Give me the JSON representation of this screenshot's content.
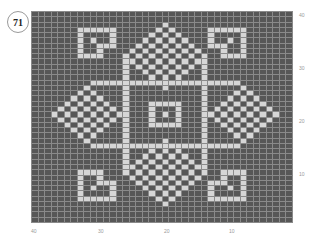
{
  "pattern_number": "71",
  "colors": {
    "background_stitch": "#575757",
    "contrast_stitch": "#d6d6d6",
    "grid_line": "#8a8a8a"
  },
  "chart": {
    "columns": 40,
    "rows": 40,
    "row_labels": [
      "40",
      "30",
      "20",
      "10"
    ],
    "column_labels": [
      "40",
      "30",
      "20",
      "10"
    ],
    "light_cells_by_row": [
      [],
      [],
      [
        20
      ],
      [
        7,
        8,
        9,
        10,
        11,
        12,
        19,
        21,
        27,
        28,
        29,
        30,
        31,
        32
      ],
      [
        7,
        12,
        18,
        20,
        22,
        27,
        32
      ],
      [
        7,
        9,
        12,
        17,
        19,
        21,
        23,
        27,
        30,
        32
      ],
      [
        7,
        10,
        11,
        12,
        16,
        18,
        20,
        22,
        24,
        27,
        28,
        29,
        32
      ],
      [
        7,
        10,
        15,
        17,
        19,
        21,
        23,
        25,
        29,
        32
      ],
      [
        7,
        8,
        9,
        10,
        14,
        16,
        18,
        20,
        22,
        24,
        26,
        29,
        30,
        31,
        32
      ],
      [
        14,
        15,
        17,
        19,
        21,
        23,
        25,
        26
      ],
      [
        14,
        16,
        18,
        20,
        22,
        24,
        26
      ],
      [
        14,
        17,
        19,
        21,
        23,
        26
      ],
      [
        14,
        18,
        20,
        22,
        26
      ],
      [
        9,
        10,
        11,
        12,
        13,
        14,
        15,
        16,
        17,
        18,
        19,
        20,
        21,
        22,
        23,
        24,
        25,
        26,
        27,
        28,
        29,
        30,
        31
      ],
      [
        8,
        14,
        20,
        26,
        32
      ],
      [
        7,
        9,
        14,
        26,
        31,
        33
      ],
      [
        6,
        8,
        10,
        14,
        26,
        30,
        32,
        34
      ],
      [
        5,
        7,
        9,
        11,
        14,
        18,
        19,
        20,
        21,
        22,
        26,
        29,
        31,
        33,
        35
      ],
      [
        4,
        6,
        8,
        10,
        12,
        14,
        18,
        22,
        26,
        28,
        30,
        32,
        34,
        36
      ],
      [
        3,
        5,
        7,
        9,
        11,
        13,
        14,
        18,
        20,
        22,
        26,
        27,
        29,
        31,
        33,
        35,
        37
      ],
      [
        4,
        6,
        8,
        10,
        12,
        14,
        18,
        22,
        26,
        28,
        30,
        32,
        34,
        36
      ],
      [
        5,
        7,
        9,
        11,
        14,
        18,
        19,
        20,
        21,
        22,
        26,
        29,
        31,
        33,
        35
      ],
      [
        6,
        8,
        10,
        14,
        26,
        30,
        32,
        34
      ],
      [
        7,
        9,
        14,
        26,
        31,
        33
      ],
      [
        8,
        14,
        20,
        26,
        32
      ],
      [
        9,
        10,
        11,
        12,
        13,
        14,
        15,
        16,
        17,
        18,
        19,
        20,
        21,
        22,
        23,
        24,
        25,
        26,
        27,
        28,
        29,
        30,
        31
      ],
      [
        14,
        18,
        20,
        22,
        26
      ],
      [
        14,
        17,
        19,
        21,
        23,
        26
      ],
      [
        14,
        16,
        18,
        20,
        22,
        24,
        26
      ],
      [
        14,
        15,
        17,
        19,
        21,
        23,
        25,
        26
      ],
      [
        7,
        8,
        9,
        10,
        14,
        16,
        18,
        20,
        22,
        24,
        26,
        29,
        30,
        31,
        32
      ],
      [
        7,
        10,
        15,
        17,
        19,
        21,
        23,
        25,
        29,
        32
      ],
      [
        7,
        10,
        11,
        12,
        16,
        18,
        20,
        22,
        24,
        27,
        28,
        29,
        32
      ],
      [
        7,
        9,
        12,
        17,
        19,
        21,
        23,
        27,
        30,
        32
      ],
      [
        7,
        12,
        18,
        20,
        22,
        27,
        32
      ],
      [
        7,
        8,
        9,
        10,
        11,
        12,
        19,
        21,
        27,
        28,
        29,
        30,
        31,
        32
      ],
      [
        20
      ],
      [],
      [],
      []
    ]
  }
}
